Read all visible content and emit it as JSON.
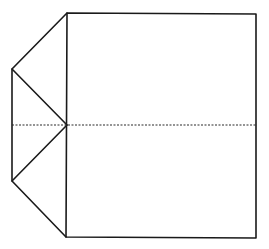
{
  "diagram": {
    "type": "line-drawing",
    "colors": {
      "background": "#ffffff",
      "stroke": "#1a1a1a"
    },
    "points": {
      "square_top_left": [
        67,
        13
      ],
      "square_top_right": [
        256,
        14
      ],
      "square_bottom_right": [
        256,
        238
      ],
      "square_bottom_left": [
        66,
        237
      ],
      "flap_top": [
        12,
        69
      ],
      "flap_bottom": [
        12,
        181
      ],
      "center_left": [
        67,
        125
      ],
      "fold_line_start": [
        12,
        125
      ],
      "fold_line_end": [
        256,
        125
      ]
    }
  }
}
